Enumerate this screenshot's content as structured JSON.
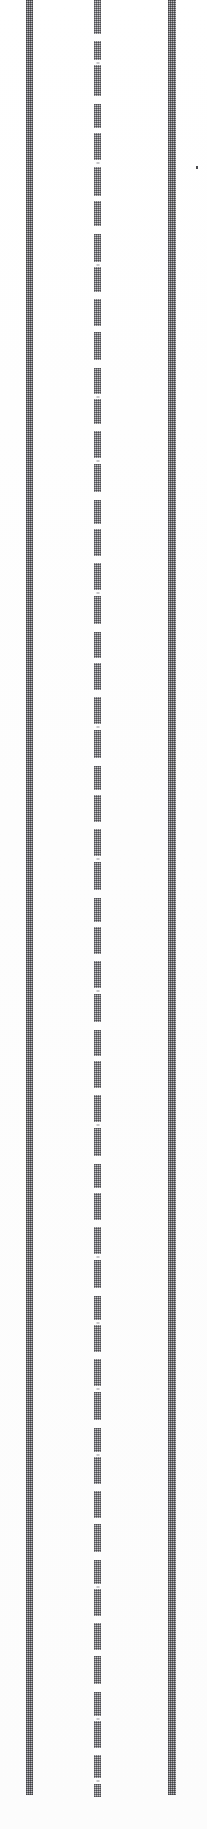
{
  "page": {
    "width_px": 207,
    "height_px": 1829,
    "background_color": "#fefefe"
  },
  "rules": [
    {
      "name": "left-rule",
      "role": "vertical-rule",
      "x_px": 26,
      "width_px": 7,
      "top_px": 0,
      "bottom_px": 1795,
      "style": "continuous",
      "color": "#8e8e92"
    },
    {
      "name": "middle-rule",
      "role": "collapsed-text-column",
      "x_px": 94,
      "width_px": 7,
      "top_px": 0,
      "bottom_px": 1797,
      "style": "segmented",
      "color": "#8a8a8e"
    },
    {
      "name": "right-rule",
      "role": "vertical-rule",
      "x_px": 168,
      "width_px": 8,
      "top_px": 0,
      "bottom_px": 1795,
      "style": "continuous",
      "color": "#9a9a9e"
    }
  ],
  "segments": {
    "note": "Gap bands (in px, top of gap) that break the middle column into discrete collapsed text lines.",
    "gaps": [
      {
        "top": 34,
        "height": 7
      },
      {
        "top": 60,
        "height": 5
      },
      {
        "top": 96,
        "height": 8
      },
      {
        "top": 128,
        "height": 5
      },
      {
        "top": 160,
        "height": 7
      },
      {
        "top": 196,
        "height": 5
      },
      {
        "top": 226,
        "height": 8
      },
      {
        "top": 262,
        "height": 5
      },
      {
        "top": 292,
        "height": 7
      },
      {
        "top": 326,
        "height": 6
      },
      {
        "top": 360,
        "height": 8
      },
      {
        "top": 394,
        "height": 5
      },
      {
        "top": 424,
        "height": 7
      },
      {
        "top": 458,
        "height": 6
      },
      {
        "top": 492,
        "height": 8
      },
      {
        "top": 524,
        "height": 5
      },
      {
        "top": 556,
        "height": 7
      },
      {
        "top": 590,
        "height": 6
      },
      {
        "top": 624,
        "height": 8
      },
      {
        "top": 658,
        "height": 5
      },
      {
        "top": 690,
        "height": 7
      },
      {
        "top": 724,
        "height": 6
      },
      {
        "top": 758,
        "height": 8
      },
      {
        "top": 790,
        "height": 5
      },
      {
        "top": 822,
        "height": 7
      },
      {
        "top": 856,
        "height": 6
      },
      {
        "top": 890,
        "height": 8
      },
      {
        "top": 922,
        "height": 5
      },
      {
        "top": 954,
        "height": 7
      },
      {
        "top": 988,
        "height": 6
      },
      {
        "top": 1022,
        "height": 8
      },
      {
        "top": 1056,
        "height": 5
      },
      {
        "top": 1088,
        "height": 7
      },
      {
        "top": 1122,
        "height": 6
      },
      {
        "top": 1156,
        "height": 8
      },
      {
        "top": 1188,
        "height": 5
      },
      {
        "top": 1220,
        "height": 7
      },
      {
        "top": 1254,
        "height": 6
      },
      {
        "top": 1288,
        "height": 8
      },
      {
        "top": 1320,
        "height": 5
      },
      {
        "top": 1352,
        "height": 7
      },
      {
        "top": 1386,
        "height": 6
      },
      {
        "top": 1420,
        "height": 8
      },
      {
        "top": 1452,
        "height": 5
      },
      {
        "top": 1484,
        "height": 7
      },
      {
        "top": 1518,
        "height": 6
      },
      {
        "top": 1552,
        "height": 8
      },
      {
        "top": 1584,
        "height": 5
      },
      {
        "top": 1616,
        "height": 7
      },
      {
        "top": 1650,
        "height": 6
      },
      {
        "top": 1684,
        "height": 8
      },
      {
        "top": 1716,
        "height": 5
      },
      {
        "top": 1748,
        "height": 7
      },
      {
        "top": 1778,
        "height": 6
      }
    ],
    "faint_marks": [
      {
        "top": 62
      },
      {
        "top": 162
      },
      {
        "top": 264
      },
      {
        "top": 396
      },
      {
        "top": 460
      },
      {
        "top": 592
      },
      {
        "top": 726
      },
      {
        "top": 858
      },
      {
        "top": 990
      },
      {
        "top": 1124
      },
      {
        "top": 1256
      },
      {
        "top": 1322
      },
      {
        "top": 1388
      },
      {
        "top": 1454
      },
      {
        "top": 1586
      },
      {
        "top": 1718
      },
      {
        "top": 1780
      }
    ]
  },
  "marks": [
    {
      "name": "ink-speck",
      "x_px": 196,
      "y_px": 166,
      "width_px": 2,
      "height_px": 3,
      "color": "#4a4a4e"
    }
  ]
}
